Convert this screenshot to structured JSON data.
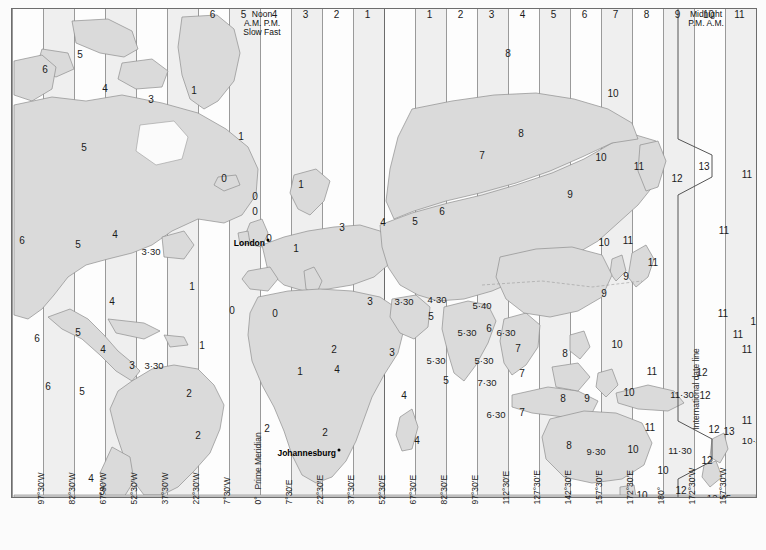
{
  "header": {
    "noon_block": {
      "line1": "Noon",
      "line2": "A.M.  P.M.",
      "line3": "Slow  Fast"
    },
    "midnight_block": {
      "line1": "Midnight",
      "line2": "P.M.   A.M."
    },
    "hours_left": [
      "6",
      "5",
      "4",
      "3",
      "2",
      "1"
    ],
    "hours_right_of_noon": [
      "1",
      "2",
      "3",
      "4",
      "5",
      "6",
      "7",
      "8",
      "9",
      "10",
      "11"
    ],
    "hour_after_midnight": "11"
  },
  "axis": {
    "longitude_labels": [
      "97°30'W",
      "82°30'W",
      "67°30'W",
      "52°30'W",
      "37°30'W",
      "22°30'W",
      "7°30'W",
      "0°",
      "7°30'E",
      "22°30'E",
      "37°30'E",
      "52°30'E",
      "67°30'E",
      "82°30'E",
      "97°30'E",
      "112°30'E",
      "127°30'E",
      "142°30'E",
      "157°30'E",
      "172°30'E",
      "180°",
      "172°30'W",
      "157°30'W"
    ]
  },
  "map_labels": {
    "prime_meridian": "Prime Meridian",
    "date_line": "International date line"
  },
  "cities": [
    {
      "name": "London",
      "x": 256,
      "y": 234
    },
    {
      "name": "Johannesburg",
      "x": 327,
      "y": 444
    }
  ],
  "zone_numbers": [
    {
      "v": "6",
      "x": 33,
      "y": 61
    },
    {
      "v": "5",
      "x": 68,
      "y": 46
    },
    {
      "v": "4",
      "x": 93,
      "y": 80
    },
    {
      "v": "1",
      "x": 182,
      "y": 82
    },
    {
      "v": "5",
      "x": 72,
      "y": 139
    },
    {
      "v": "3",
      "x": 139,
      "y": 91
    },
    {
      "v": "1",
      "x": 229,
      "y": 128
    },
    {
      "v": "1",
      "x": 289,
      "y": 176
    },
    {
      "v": "0",
      "x": 212,
      "y": 170
    },
    {
      "v": "0",
      "x": 243,
      "y": 188
    },
    {
      "v": "0",
      "x": 243,
      "y": 203
    },
    {
      "v": "6",
      "x": 10,
      "y": 232
    },
    {
      "v": "5",
      "x": 66,
      "y": 236
    },
    {
      "v": "4",
      "x": 103,
      "y": 226
    },
    {
      "v": "3·30",
      "x": 139,
      "y": 243
    },
    {
      "v": "0",
      "x": 257,
      "y": 230
    },
    {
      "v": "1",
      "x": 284,
      "y": 240
    },
    {
      "v": "3",
      "x": 330,
      "y": 219
    },
    {
      "v": "4",
      "x": 371,
      "y": 214
    },
    {
      "v": "5",
      "x": 403,
      "y": 213
    },
    {
      "v": "6",
      "x": 430,
      "y": 203
    },
    {
      "v": "7",
      "x": 470,
      "y": 147
    },
    {
      "v": "8",
      "x": 496,
      "y": 45
    },
    {
      "v": "8",
      "x": 509,
      "y": 125
    },
    {
      "v": "10",
      "x": 601,
      "y": 85
    },
    {
      "v": "10",
      "x": 589,
      "y": 149
    },
    {
      "v": "11",
      "x": 627,
      "y": 158
    },
    {
      "v": "12",
      "x": 665,
      "y": 170
    },
    {
      "v": "13",
      "x": 692,
      "y": 158
    },
    {
      "v": "11",
      "x": 735,
      "y": 166
    },
    {
      "v": "10",
      "x": 751,
      "y": 166
    },
    {
      "v": "9",
      "x": 558,
      "y": 186
    },
    {
      "v": "11",
      "x": 712,
      "y": 222
    },
    {
      "v": "10",
      "x": 592,
      "y": 234
    },
    {
      "v": "11",
      "x": 616,
      "y": 232
    },
    {
      "v": "11",
      "x": 641,
      "y": 254
    },
    {
      "v": "9",
      "x": 614,
      "y": 268
    },
    {
      "v": "1",
      "x": 180,
      "y": 278
    },
    {
      "v": "0",
      "x": 220,
      "y": 302
    },
    {
      "v": "0",
      "x": 263,
      "y": 305
    },
    {
      "v": "3",
      "x": 358,
      "y": 293
    },
    {
      "v": "3·30",
      "x": 392,
      "y": 293
    },
    {
      "v": "4·30",
      "x": 425,
      "y": 291
    },
    {
      "v": "5·40",
      "x": 470,
      "y": 297
    },
    {
      "v": "5",
      "x": 419,
      "y": 308
    },
    {
      "v": "9",
      "x": 592,
      "y": 285
    },
    {
      "v": "4",
      "x": 100,
      "y": 293
    },
    {
      "v": "6",
      "x": 25,
      "y": 330
    },
    {
      "v": "5",
      "x": 66,
      "y": 324
    },
    {
      "v": "4",
      "x": 91,
      "y": 341
    },
    {
      "v": "3",
      "x": 120,
      "y": 357
    },
    {
      "v": "3·30",
      "x": 142,
      "y": 357
    },
    {
      "v": "1",
      "x": 190,
      "y": 337
    },
    {
      "v": "2",
      "x": 177,
      "y": 385
    },
    {
      "v": "2",
      "x": 186,
      "y": 427
    },
    {
      "v": "6",
      "x": 36,
      "y": 378
    },
    {
      "v": "5",
      "x": 70,
      "y": 383
    },
    {
      "v": "1",
      "x": 288,
      "y": 363
    },
    {
      "v": "2",
      "x": 313,
      "y": 424
    },
    {
      "v": "3",
      "x": 380,
      "y": 344
    },
    {
      "v": "4",
      "x": 392,
      "y": 387
    },
    {
      "v": "4",
      "x": 405,
      "y": 432
    },
    {
      "v": "5·30",
      "x": 455,
      "y": 324
    },
    {
      "v": "6",
      "x": 477,
      "y": 320
    },
    {
      "v": "6·30",
      "x": 494,
      "y": 324
    },
    {
      "v": "5·30",
      "x": 424,
      "y": 352
    },
    {
      "v": "5·30",
      "x": 472,
      "y": 352
    },
    {
      "v": "5",
      "x": 434,
      "y": 372
    },
    {
      "v": "7·30",
      "x": 475,
      "y": 374
    },
    {
      "v": "7",
      "x": 506,
      "y": 340
    },
    {
      "v": "7",
      "x": 510,
      "y": 365
    },
    {
      "v": "7",
      "x": 510,
      "y": 404
    },
    {
      "v": "6·30",
      "x": 484,
      "y": 406
    },
    {
      "v": "8",
      "x": 553,
      "y": 345
    },
    {
      "v": "8",
      "x": 551,
      "y": 390
    },
    {
      "v": "8",
      "x": 557,
      "y": 437
    },
    {
      "v": "9",
      "x": 575,
      "y": 390
    },
    {
      "v": "9·30",
      "x": 584,
      "y": 443
    },
    {
      "v": "10",
      "x": 605,
      "y": 336
    },
    {
      "v": "10",
      "x": 617,
      "y": 384
    },
    {
      "v": "10",
      "x": 621,
      "y": 441
    },
    {
      "v": "10",
      "x": 651,
      "y": 462
    },
    {
      "v": "10",
      "x": 630,
      "y": 487
    },
    {
      "v": "11",
      "x": 640,
      "y": 363
    },
    {
      "v": "11",
      "x": 638,
      "y": 419
    },
    {
      "v": "11·30",
      "x": 670,
      "y": 386
    },
    {
      "v": "11·30",
      "x": 668,
      "y": 442
    },
    {
      "v": "12",
      "x": 690,
      "y": 364
    },
    {
      "v": "12",
      "x": 693,
      "y": 387
    },
    {
      "v": "12",
      "x": 702,
      "y": 421
    },
    {
      "v": "13",
      "x": 717,
      "y": 423
    },
    {
      "v": "11",
      "x": 735,
      "y": 412
    },
    {
      "v": "10·30",
      "x": 742,
      "y": 432
    },
    {
      "v": "12",
      "x": 695,
      "y": 452
    },
    {
      "v": "12",
      "x": 669,
      "y": 482
    },
    {
      "v": "12·45",
      "x": 707,
      "y": 489
    },
    {
      "v": "11",
      "x": 711,
      "y": 305
    },
    {
      "v": "11",
      "x": 726,
      "y": 326
    },
    {
      "v": "10",
      "x": 744,
      "y": 313
    },
    {
      "v": "11",
      "x": 735,
      "y": 341
    },
    {
      "v": "2",
      "x": 255,
      "y": 420
    },
    {
      "v": "3",
      "x": 90,
      "y": 483
    },
    {
      "v": "4",
      "x": 79,
      "y": 470
    },
    {
      "v": "2",
      "x": 207,
      "y": 497
    },
    {
      "v": "5",
      "x": 414,
      "y": 496
    },
    {
      "v": "4",
      "x": 325,
      "y": 361
    },
    {
      "v": "2",
      "x": 322,
      "y": 341
    }
  ]
}
